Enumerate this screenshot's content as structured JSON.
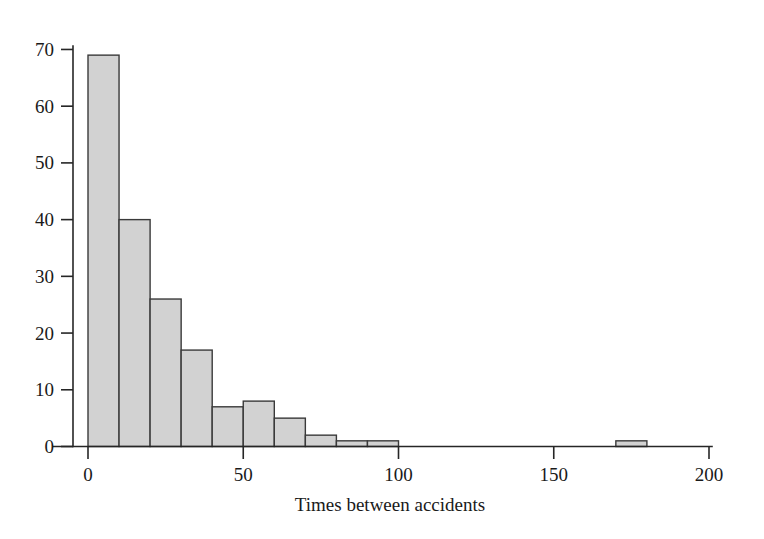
{
  "chart_data": {
    "type": "bar",
    "title": "",
    "subtitle": "",
    "xlabel": "Times between accidents",
    "ylabel": "",
    "bin_width": 10,
    "bin_starts": [
      0,
      10,
      20,
      30,
      40,
      50,
      60,
      70,
      80,
      90,
      170
    ],
    "categories": [
      "0-10",
      "10-20",
      "20-30",
      "30-40",
      "40-50",
      "50-60",
      "60-70",
      "70-80",
      "80-90",
      "90-100",
      "170-180"
    ],
    "values": [
      69,
      40,
      26,
      17,
      7,
      8,
      5,
      2,
      1,
      1,
      1
    ],
    "xlim": [
      -5,
      210
    ],
    "ylim": [
      0,
      72
    ],
    "xticks": [
      0,
      50,
      100,
      150,
      200
    ],
    "xtick_labels": [
      "0",
      "50",
      "100",
      "150",
      "200"
    ],
    "yticks": [
      0,
      10,
      20,
      30,
      40,
      50,
      60,
      70
    ],
    "ytick_labels": [
      "0",
      "10",
      "20",
      "30",
      "40",
      "50",
      "60",
      "70"
    ],
    "grid": false,
    "legend": false,
    "legend_position": "none",
    "bar_fill_color": "#d2d2d2",
    "bar_edge_color": "#3a3a3a",
    "axis_color": "#262626",
    "background_color": "#ffffff"
  }
}
